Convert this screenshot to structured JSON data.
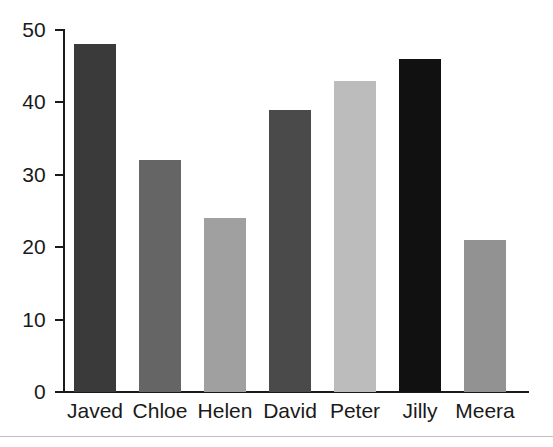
{
  "chart_data": {
    "type": "bar",
    "title": "",
    "subtitle": "",
    "xlabel": "",
    "ylabel": "",
    "categories": [
      "Javed",
      "Chloe",
      "Helen",
      "David",
      "Peter",
      "Jilly",
      "Meera"
    ],
    "values": [
      48,
      32,
      24,
      39,
      43,
      46,
      21
    ],
    "bar_colors": [
      "#3a3a3a",
      "#656565",
      "#a0a0a0",
      "#4a4a4a",
      "#bcbcbc",
      "#111111",
      "#929292"
    ],
    "ylim": [
      0,
      50
    ],
    "ytick_labels": [
      "0",
      "10",
      "20",
      "30",
      "40",
      "50"
    ],
    "ytick_values": [
      0,
      10,
      20,
      30,
      40,
      50
    ],
    "grid": false,
    "legend": false,
    "legend_position": "none",
    "axis_color": "#1a1a1a",
    "background_color": "#ffffff",
    "bottom_rule_color": "#bfbfbf"
  }
}
